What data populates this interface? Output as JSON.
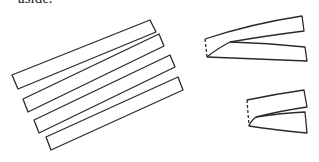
{
  "caption": "aside.",
  "figure": {
    "flat_strips": [
      {
        "name": "strip-1",
        "points": "12,75 150,20 156,32 18,89"
      },
      {
        "name": "strip-2",
        "points": "23,99 159,34 164,46 28,112"
      },
      {
        "name": "strip-3",
        "points": "34,120 170,55 175,67 39,133"
      },
      {
        "name": "strip-4",
        "points": "46,137 178,77 183,90 51,150"
      }
    ],
    "folded_strip_large": {
      "top": "M205,39 Q250,24 302,16 L304,31 Q265,36 230,42 Q215,50 207,57",
      "bottom": "M230,42 Q268,43 305,47 L307,61 Q255,59 207,57",
      "fold_edge": "M205,39 L207,57"
    },
    "folded_strip_small": {
      "top": "M247,100 Q276,94 304,90 L307,107 Q280,111 256,117 Q250,122 249,126",
      "bottom": "M256,117 Q282,113 305,112 L307,133 Q275,130 249,126",
      "fold_edge": "M247,100 L249,126"
    }
  }
}
